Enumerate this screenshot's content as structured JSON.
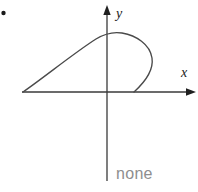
{
  "figure": {
    "bullet_marker": "•",
    "axes": {
      "x_label": "x",
      "y_label": "y",
      "x_axis_name": "horizontal-axis",
      "y_axis_name": "vertical-axis",
      "x_arrow_icon": "arrow-right-icon",
      "y_arrow_icon": "arrow-up-icon",
      "axis_color": "#3a3a3a",
      "origin": {
        "x": 107,
        "y": 92
      },
      "x_range_px": [
        22,
        196
      ],
      "y_range_px": [
        5,
        181
      ]
    },
    "curve": {
      "name": "loop-curve",
      "color": "#4a4a4a",
      "description": "closed loop meeting the x-axis at two points",
      "x_axis_intersections_px": [
        23,
        134
      ],
      "apex_px": {
        "x": 116,
        "y": 33
      },
      "rightmost_px": {
        "x": 152,
        "y": 58
      },
      "y_axis_crossing_px": {
        "x": 107,
        "y": 34
      }
    }
  },
  "caption": {
    "text": "none",
    "color": "#8e8e8e"
  }
}
